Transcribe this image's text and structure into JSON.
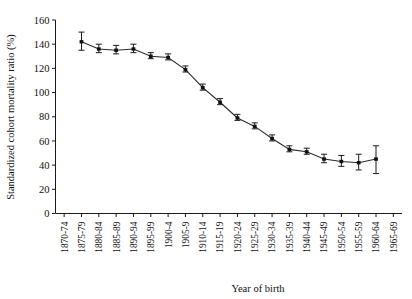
{
  "chart_data": {
    "type": "line",
    "title": "",
    "xlabel": "Year of birth",
    "ylabel": "Standardized cohort mortality ratio (%)",
    "ylim": [
      0,
      160
    ],
    "yticks": [
      0,
      20,
      40,
      60,
      80,
      100,
      120,
      140,
      160
    ],
    "grid": false,
    "legend": "none",
    "error_bars": true,
    "categories": [
      "1870-74",
      "1875-79",
      "1880-84",
      "1885-89",
      "1890-94",
      "1895-99",
      "1900-4",
      "1905-9",
      "1910-14",
      "1915-19",
      "1920-24",
      "1925-29",
      "1930-34",
      "1935-39",
      "1940-44",
      "1945-49",
      "1950-54",
      "1955-59",
      "1960-64",
      "1965-69"
    ],
    "series": [
      {
        "name": "Standardized cohort mortality ratio",
        "values": [
          null,
          142,
          136,
          135,
          136,
          130,
          129,
          119,
          104,
          92,
          79,
          72,
          62,
          53,
          51,
          45,
          43,
          42,
          45,
          null
        ],
        "err_low": [
          null,
          135,
          133,
          132,
          133,
          128,
          127,
          117,
          102,
          90,
          77,
          70,
          60,
          51,
          49,
          42,
          39,
          36,
          33,
          null
        ],
        "err_high": [
          null,
          150,
          140,
          139,
          140,
          133,
          132,
          122,
          107,
          95,
          82,
          75,
          65,
          56,
          54,
          49,
          48,
          49,
          56,
          null
        ]
      }
    ]
  }
}
